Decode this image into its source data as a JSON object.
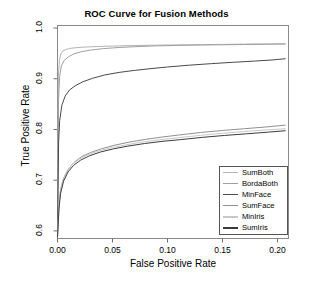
{
  "chart_data": {
    "type": "line",
    "title": "ROC Curve for Fusion Methods",
    "xlabel": "False Positive Rate",
    "ylabel": "True Positive Rate",
    "xlim": [
      0.0,
      0.21
    ],
    "ylim": [
      0.585,
      1.005
    ],
    "xticks": [
      "0.00",
      "0.05",
      "0.10",
      "0.15",
      "0.20"
    ],
    "xtick_values": [
      0.0,
      0.05,
      0.1,
      0.15,
      0.2
    ],
    "yticks": [
      "0.6",
      "0.7",
      "0.8",
      "0.9",
      "1.0"
    ],
    "ytick_values": [
      0.6,
      0.7,
      0.8,
      0.9,
      1.0
    ],
    "grid": false,
    "legend_position": "bottom-right",
    "series": [
      {
        "name": "SumBoth",
        "color": "#b4b4b4",
        "x": [
          0.0,
          0.0008,
          0.0018,
          0.003,
          0.005,
          0.008,
          0.012,
          0.018,
          0.025,
          0.035,
          0.05,
          0.07,
          0.09,
          0.11,
          0.13,
          0.15,
          0.17,
          0.19,
          0.207
        ],
        "y": [
          0.588,
          0.905,
          0.938,
          0.949,
          0.955,
          0.958,
          0.96,
          0.9615,
          0.9625,
          0.9635,
          0.9645,
          0.9655,
          0.9662,
          0.9668,
          0.9673,
          0.9678,
          0.9683,
          0.9688,
          0.969
        ]
      },
      {
        "name": "BordaBoth",
        "color": "#a0a0a0",
        "x": [
          0.0,
          0.001,
          0.002,
          0.0035,
          0.006,
          0.01,
          0.015,
          0.022,
          0.03,
          0.042,
          0.055,
          0.07,
          0.09,
          0.11,
          0.13,
          0.15,
          0.17,
          0.19,
          0.207
        ],
        "y": [
          0.588,
          0.862,
          0.905,
          0.925,
          0.936,
          0.9435,
          0.949,
          0.9535,
          0.9565,
          0.9595,
          0.9615,
          0.9632,
          0.9648,
          0.9658,
          0.9665,
          0.967,
          0.9675,
          0.968,
          0.9685
        ]
      },
      {
        "name": "MinFace",
        "color": "#4a4a4a",
        "x": [
          0.0,
          0.001,
          0.002,
          0.004,
          0.007,
          0.011,
          0.016,
          0.023,
          0.032,
          0.043,
          0.056,
          0.07,
          0.085,
          0.1,
          0.12,
          0.14,
          0.16,
          0.18,
          0.195,
          0.207
        ],
        "y": [
          0.588,
          0.775,
          0.818,
          0.848,
          0.866,
          0.878,
          0.886,
          0.894,
          0.901,
          0.9075,
          0.9125,
          0.9165,
          0.92,
          0.9232,
          0.9268,
          0.9298,
          0.9325,
          0.935,
          0.937,
          0.9395
        ]
      },
      {
        "name": "SumFace",
        "color": "#909090",
        "x": [
          0.0,
          0.0015,
          0.003,
          0.006,
          0.01,
          0.015,
          0.022,
          0.03,
          0.04,
          0.052,
          0.065,
          0.08,
          0.095,
          0.11,
          0.13,
          0.15,
          0.17,
          0.19,
          0.207
        ],
        "y": [
          0.588,
          0.655,
          0.684,
          0.706,
          0.722,
          0.735,
          0.7465,
          0.7545,
          0.762,
          0.769,
          0.775,
          0.7805,
          0.785,
          0.789,
          0.794,
          0.798,
          0.8015,
          0.805,
          0.8085
        ]
      },
      {
        "name": "MinIris",
        "color": "#c8c8c8",
        "x": [
          0.0,
          0.0012,
          0.0025,
          0.005,
          0.009,
          0.014,
          0.02,
          0.028,
          0.038,
          0.05,
          0.063,
          0.078,
          0.094,
          0.11,
          0.13,
          0.15,
          0.17,
          0.19,
          0.207
        ],
        "y": [
          0.588,
          0.648,
          0.678,
          0.702,
          0.719,
          0.732,
          0.742,
          0.7505,
          0.758,
          0.7645,
          0.77,
          0.7755,
          0.78,
          0.7838,
          0.7885,
          0.7925,
          0.796,
          0.799,
          0.8015
        ]
      },
      {
        "name": "SumIris",
        "color": "#3c3c3c",
        "x": [
          0.0,
          0.0014,
          0.0028,
          0.0055,
          0.0095,
          0.0145,
          0.021,
          0.029,
          0.039,
          0.051,
          0.064,
          0.079,
          0.095,
          0.112,
          0.132,
          0.152,
          0.172,
          0.192,
          0.207
        ],
        "y": [
          0.588,
          0.645,
          0.674,
          0.698,
          0.716,
          0.729,
          0.7395,
          0.748,
          0.7555,
          0.7618,
          0.7672,
          0.7722,
          0.7765,
          0.78,
          0.7845,
          0.7882,
          0.7915,
          0.7948,
          0.7975
        ]
      }
    ]
  },
  "legend": {
    "items": [
      {
        "label": "SumBoth"
      },
      {
        "label": "BordaBoth"
      },
      {
        "label": "MinFace"
      },
      {
        "label": "SumFace"
      },
      {
        "label": "MinIris"
      },
      {
        "label": "SumIris"
      }
    ]
  }
}
